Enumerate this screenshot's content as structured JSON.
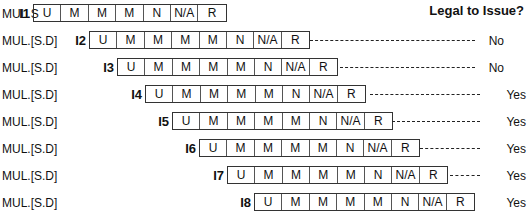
{
  "header": {
    "title": "Legal to Issue?"
  },
  "rows": [
    {
      "op": "MUL.S",
      "inst": "I1",
      "stages": [
        "U",
        "M",
        "M",
        "M",
        "N",
        "N/A",
        "R"
      ],
      "legal": "",
      "top": 4,
      "box_left": 33,
      "dash": null
    },
    {
      "op": "MUL.[S.D]",
      "inst": "I2",
      "stages": [
        "U",
        "M",
        "M",
        "M",
        "M",
        "N",
        "N/A",
        "R"
      ],
      "legal": "No",
      "top": 31,
      "box_left": 89,
      "dash": [
        310,
        475
      ]
    },
    {
      "op": "MUL.[S.D]",
      "inst": "I3",
      "stages": [
        "U",
        "M",
        "M",
        "M",
        "M",
        "N",
        "N/A",
        "R"
      ],
      "legal": "No",
      "top": 58,
      "box_left": 117,
      "dash": [
        340,
        475
      ]
    },
    {
      "op": "MUL.[S.D]",
      "inst": "I4",
      "stages": [
        "U",
        "M",
        "M",
        "M",
        "M",
        "N",
        "N/A",
        "R"
      ],
      "legal": "Yes",
      "top": 85,
      "box_left": 145,
      "dash": [
        370,
        480
      ]
    },
    {
      "op": "MUL.[S.D]",
      "inst": "I5",
      "stages": [
        "U",
        "M",
        "M",
        "M",
        "M",
        "N",
        "N/A",
        "R"
      ],
      "legal": "Yes",
      "top": 112,
      "box_left": 172,
      "dash": [
        392,
        480
      ]
    },
    {
      "op": "MUL.[S.D]",
      "inst": "I6",
      "stages": [
        "U",
        "M",
        "M",
        "M",
        "M",
        "N",
        "N/A",
        "R"
      ],
      "legal": "Yes",
      "top": 139,
      "box_left": 199,
      "dash": [
        420,
        480
      ]
    },
    {
      "op": "MUL.[S.D]",
      "inst": "I7",
      "stages": [
        "U",
        "M",
        "M",
        "M",
        "M",
        "N",
        "N/A",
        "R"
      ],
      "legal": "Yes",
      "top": 166,
      "box_left": 227,
      "dash": [
        450,
        480
      ]
    },
    {
      "op": "MUL.[S.D]",
      "inst": "I8",
      "stages": [
        "U",
        "M",
        "M",
        "M",
        "M",
        "N",
        "N/A",
        "R"
      ],
      "legal": "Yes",
      "top": 193,
      "box_left": 254,
      "dash": null
    }
  ]
}
